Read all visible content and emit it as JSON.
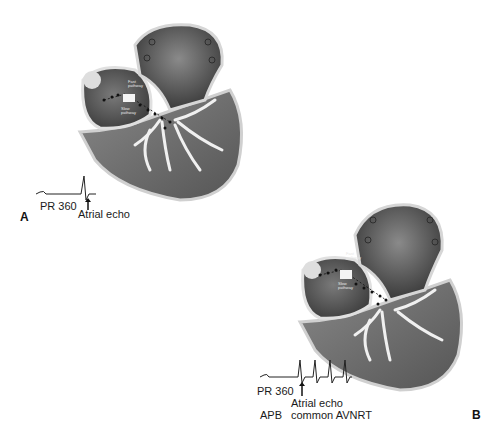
{
  "panels": [
    {
      "letter": "A",
      "pathway_labels": {
        "fast": "Fast pathway",
        "slow": "Slow pathway"
      },
      "ecg": {
        "pr_label": "PR 360",
        "arrow_label": "Atrial echo"
      }
    },
    {
      "letter": "B",
      "pathway_labels": {
        "fast": "Fast pathway",
        "slow": "Slow pathway"
      },
      "ecg": {
        "pr_label": "PR 360",
        "apb_label": "APB",
        "arrow_label_line1": "Atrial echo",
        "arrow_label_line2": "common AVNRT"
      }
    }
  ],
  "colors": {
    "heart_dark": "#3c3c3c",
    "heart_mid": "#6a6a6a",
    "heart_light": "#9a9a9a",
    "conduction": "#f2f2f2",
    "outline": "#d8d8d8"
  }
}
